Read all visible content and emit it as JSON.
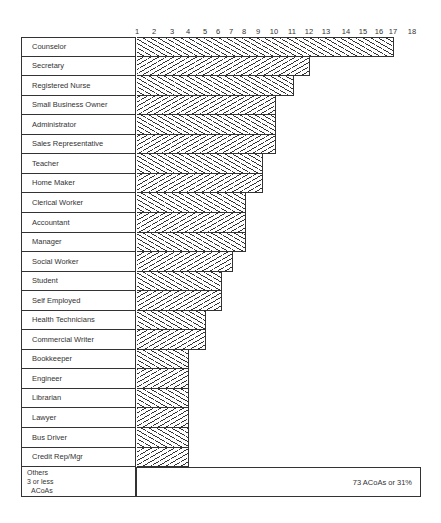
{
  "chart_data": {
    "type": "bar",
    "orientation": "horizontal",
    "title": "",
    "xlabel": "",
    "ylabel": "",
    "x_ticks": [
      1,
      2,
      3,
      4,
      5,
      6,
      7,
      8,
      9,
      10,
      11,
      12,
      13,
      14,
      15,
      16,
      17,
      18
    ],
    "x_tick_positions_px": [
      137,
      154,
      172,
      188,
      205,
      218,
      231,
      244,
      258,
      274,
      292,
      309,
      326,
      346,
      363,
      379,
      393,
      412
    ],
    "xlim": [
      1,
      18
    ],
    "grid": false,
    "legend": null,
    "categories": [
      "Counselor",
      "Secretary",
      "Registered Nurse",
      "Small Business Owner",
      "Administrator",
      "Sales Representative",
      "Teacher",
      "Home Maker",
      "Clerical Worker",
      "Accountant",
      "Manager",
      "Social Worker",
      "Student",
      "Self Employed",
      "Health Technicians",
      "Commercial Writer",
      "Bookkeeper",
      "Engineer",
      "Librarian",
      "Lawyer",
      "Bus Driver",
      "Credit Rep/Mgr"
    ],
    "values": [
      17,
      12,
      11,
      10,
      10,
      10,
      9,
      9,
      8,
      8,
      8,
      7,
      6,
      6,
      5,
      5,
      4,
      4,
      4,
      4,
      4,
      4
    ],
    "bar_end_px": [
      393,
      309,
      293,
      275,
      275,
      275,
      262,
      262,
      245,
      245,
      245,
      232,
      221,
      221,
      205,
      205,
      188,
      188,
      188,
      188,
      188,
      188
    ],
    "hatch_pattern": [
      "back",
      "fwd",
      "back",
      "fwd",
      "back",
      "fwd",
      "back",
      "fwd",
      "back",
      "fwd",
      "back",
      "fwd",
      "back",
      "fwd",
      "back",
      "fwd",
      "back",
      "fwd",
      "back",
      "fwd",
      "back",
      "fwd"
    ],
    "others": {
      "label_lines": [
        "Others",
        "3 or less",
        "ACoAs"
      ],
      "annotation": "73 ACoAs or 31%"
    }
  }
}
